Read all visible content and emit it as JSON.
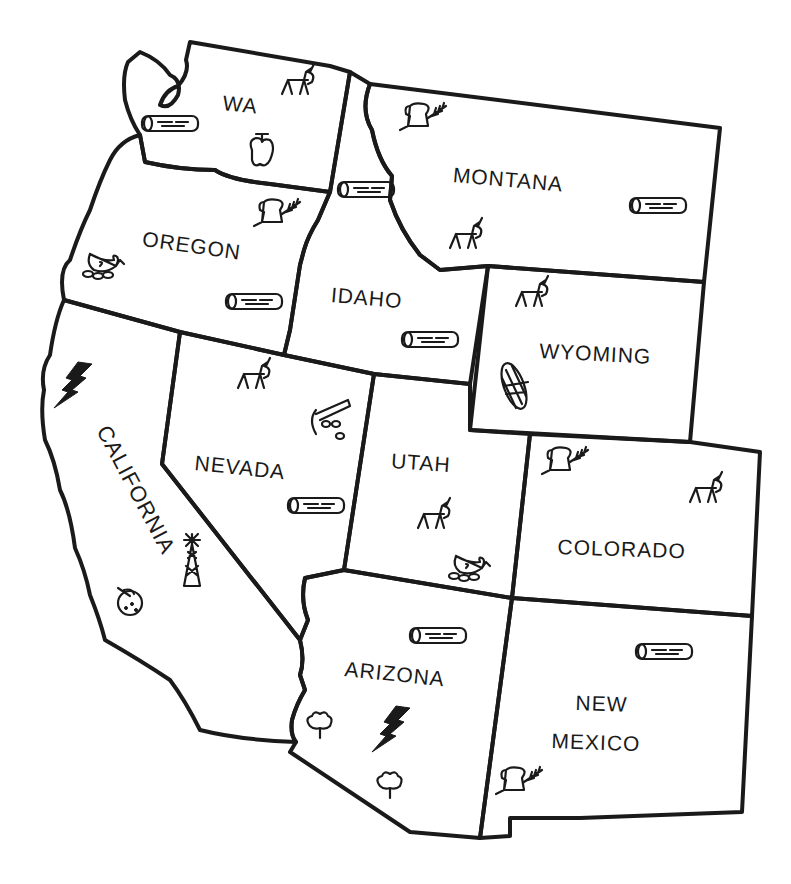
{
  "map": {
    "title": "Western United States resource map",
    "style": "hand-drawn line art",
    "line_color": "#1a1a1a",
    "background": "#ffffff"
  },
  "states": [
    {
      "id": "wa",
      "label": "WA",
      "icons": [
        "cattle-icon",
        "lumber-log-icon",
        "apple-icon"
      ]
    },
    {
      "id": "oregon",
      "label": "OREGON",
      "icons": [
        "bread-wheat-icon",
        "poultry-icon",
        "lumber-log-icon"
      ]
    },
    {
      "id": "california",
      "label": "CALIFORNIA",
      "icons": [
        "lightning-bolt-icon",
        "oil-derrick-icon",
        "orange-fruit-icon"
      ]
    },
    {
      "id": "idaho",
      "label": "IDAHO",
      "icons": [
        "lumber-log-icon",
        "lumber-log-icon"
      ]
    },
    {
      "id": "nevada",
      "label": "NEVADA",
      "icons": [
        "cattle-icon",
        "mining-pick-icon",
        "lumber-log-icon"
      ]
    },
    {
      "id": "montana",
      "label": "MONTANA",
      "icons": [
        "bread-wheat-icon",
        "lumber-log-icon",
        "cattle-icon"
      ]
    },
    {
      "id": "wyoming",
      "label": "WYOMING",
      "icons": [
        "cattle-icon",
        "corn-icon"
      ]
    },
    {
      "id": "utah",
      "label": "UTAH",
      "icons": [
        "cattle-icon",
        "poultry-icon"
      ]
    },
    {
      "id": "colorado",
      "label": "COLORADO",
      "icons": [
        "bread-wheat-icon",
        "cattle-icon"
      ]
    },
    {
      "id": "arizona",
      "label": "ARIZONA",
      "icons": [
        "lumber-log-icon",
        "cotton-icon",
        "lightning-bolt-icon",
        "cotton-icon"
      ]
    },
    {
      "id": "new_mexico",
      "label_line1": "NEW",
      "label_line2": "MEXICO",
      "icons": [
        "lumber-log-icon",
        "bread-wheat-icon"
      ]
    }
  ]
}
